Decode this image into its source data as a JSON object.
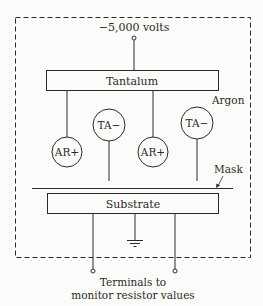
{
  "diagram": {
    "top_cutoff_text": "",
    "voltage_label": "−5,000 volts",
    "target_label": "Tantalum",
    "gas_label": "Argon",
    "ions": [
      {
        "label": "AR+",
        "type": "argon-positive-ion"
      },
      {
        "label": "TA−",
        "type": "tantalum-negative-ion"
      },
      {
        "label": "AR+",
        "type": "argon-positive-ion"
      },
      {
        "label": "TA−",
        "type": "tantalum-negative-ion"
      }
    ],
    "mask_label": "Mask",
    "substrate_label": "Substrate",
    "terminals_label_line1": "Terminals to",
    "terminals_label_line2": "monitor resistor values",
    "colors": {
      "ink": "#2a2a2a",
      "background": "#fbfbf9"
    }
  }
}
